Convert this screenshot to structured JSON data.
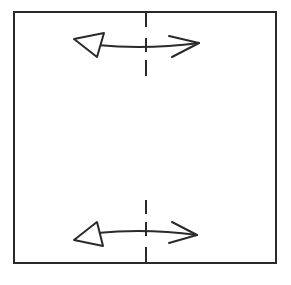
{
  "diagram": {
    "title": "",
    "stroke_color": "#2a2a2a",
    "background": "#ffffff",
    "square": {
      "x": 14,
      "y": 12,
      "width": 262,
      "height": 251
    },
    "fold_line": {
      "x": 146,
      "style": "dashed",
      "segments": [
        {
          "y1": 12,
          "y2": 27
        },
        {
          "y1": 38,
          "y2": 52
        },
        {
          "y1": 60,
          "y2": 76
        },
        {
          "y1": 200,
          "y2": 214
        },
        {
          "y1": 222,
          "y2": 236
        },
        {
          "y1": 247,
          "y2": 263
        }
      ]
    },
    "arrows": [
      {
        "name": "top-fold-arrow",
        "type": "double-headed",
        "y": 46,
        "left_head": "hollow-triangle",
        "right_head": "open-chevron",
        "x_start": 74,
        "x_end": 199
      },
      {
        "name": "bottom-fold-arrow",
        "type": "double-headed",
        "y": 235,
        "left_head": "hollow-triangle",
        "right_head": "open-chevron",
        "x_start": 74,
        "x_end": 197
      }
    ]
  }
}
